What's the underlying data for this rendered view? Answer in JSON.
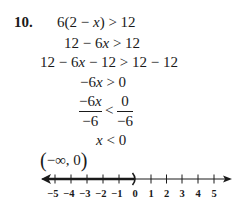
{
  "problem": {
    "number": "10.",
    "steps": [
      {
        "lhs": "6(2 − x)",
        "op": ">",
        "rhs": "12"
      },
      {
        "lhs": "12 − 6x",
        "op": ">",
        "rhs": "12"
      },
      {
        "lhs": "12 − 6x − 12",
        "op": ">",
        "rhs": "12 − 12"
      },
      {
        "lhs": "−6x",
        "op": ">",
        "rhs": "0"
      }
    ],
    "fraction_step": {
      "left_num": "−6x",
      "left_den": "−6",
      "op": "<",
      "right_num": "0",
      "right_den": "−6"
    },
    "result": {
      "lhs": "x",
      "op": "<",
      "rhs": "0"
    },
    "interval": {
      "open": "(",
      "text": "−∞, 0",
      "close": ")"
    }
  },
  "number_line": {
    "min": -5,
    "max": 5,
    "tick_labels": [
      "−5",
      "−4",
      "−3",
      "−2",
      "−1",
      "0",
      "1",
      "2",
      "3",
      "4",
      "5"
    ],
    "shaded_from": "-infinity",
    "shaded_to": 0,
    "endpoint_symbol": ")",
    "endpoint_type": "open",
    "line_color": "#1a1a1a"
  }
}
